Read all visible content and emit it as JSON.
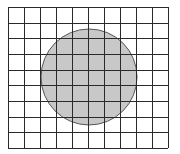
{
  "diagram": {
    "type": "grid-with-circle",
    "grid": {
      "columns": 10,
      "rows": 9,
      "x0": 8,
      "y0": 7,
      "x1": 168,
      "y1": 148,
      "line_color": "#2a2a2a"
    },
    "circle": {
      "cx": 89,
      "cy": 77,
      "r": 48,
      "fill": "#c8c8c8",
      "stroke": "#555555"
    }
  }
}
